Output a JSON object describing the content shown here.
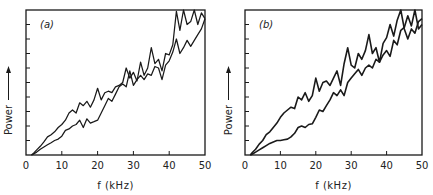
{
  "chart_data": [
    {
      "type": "line",
      "panel_label": "(a)",
      "title": "",
      "xlabel": "f (kHz)",
      "ylabel": "Power",
      "ylabel_arrow": true,
      "xlim": [
        0,
        50
      ],
      "ylim": [
        0,
        10
      ],
      "x_ticks": [
        0,
        10,
        20,
        30,
        40,
        50
      ],
      "x_tick_labels": [
        "0",
        "10",
        "20",
        "30",
        "40",
        "50"
      ],
      "y_ticks_unlabeled": 10,
      "grid": false,
      "legend": null,
      "x": [
        1.5,
        2,
        3,
        4,
        5,
        6,
        7,
        8,
        9,
        10,
        11,
        12,
        13,
        14,
        15,
        16,
        17,
        18,
        19,
        20,
        21,
        22,
        23,
        24,
        25,
        26,
        27,
        28,
        29,
        30,
        31,
        32,
        33,
        34,
        35,
        36,
        37,
        38,
        39,
        40,
        41,
        42,
        43,
        44,
        45,
        46,
        47,
        48,
        49,
        50
      ],
      "series": [
        {
          "name": "upper trace",
          "values": [
            0,
            0.1,
            0.35,
            0.6,
            0.9,
            1.25,
            1.4,
            1.6,
            1.9,
            2.1,
            2.4,
            2.9,
            3.1,
            2.9,
            3.6,
            3.4,
            3.7,
            3.3,
            3.8,
            4.6,
            3.8,
            4.3,
            4.4,
            4.3,
            4.7,
            4.8,
            5.0,
            6.0,
            5.3,
            5.7,
            5.1,
            6.4,
            5.5,
            6.0,
            7.4,
            6.3,
            6.6,
            5.8,
            7.0,
            6.9,
            7.6,
            9.9,
            8.6,
            10.0,
            9.0,
            9.2,
            10.0,
            9.0,
            9.8,
            9.4
          ]
        },
        {
          "name": "lower trace",
          "values": [
            0,
            0.05,
            0.2,
            0.4,
            0.55,
            0.7,
            0.85,
            1.0,
            1.1,
            1.3,
            1.7,
            1.8,
            2.0,
            2.1,
            2.4,
            1.9,
            2.5,
            2.2,
            2.3,
            2.4,
            2.9,
            3.4,
            3.9,
            3.7,
            4.2,
            4.7,
            4.9,
            4.7,
            5.8,
            4.8,
            5.2,
            5.5,
            5.2,
            5.6,
            5.5,
            6.1,
            6.0,
            5.2,
            6.2,
            6.5,
            7.1,
            8.0,
            7.0,
            7.4,
            7.9,
            7.5,
            7.9,
            8.3,
            8.7,
            9.4
          ]
        }
      ]
    },
    {
      "type": "line",
      "panel_label": "(b)",
      "title": "",
      "xlabel": "f (kHz)",
      "ylabel": "Power",
      "ylabel_arrow": true,
      "xlim": [
        0,
        50
      ],
      "ylim": [
        0,
        10
      ],
      "x_ticks": [
        0,
        10,
        20,
        30,
        40,
        50
      ],
      "x_tick_labels": [
        "0",
        "10",
        "20",
        "30",
        "40",
        "50"
      ],
      "y_ticks_unlabeled": 10,
      "grid": false,
      "legend": null,
      "x": [
        1.5,
        2,
        3,
        4,
        5,
        6,
        7,
        8,
        9,
        10,
        11,
        12,
        13,
        14,
        15,
        16,
        17,
        18,
        19,
        20,
        21,
        22,
        23,
        24,
        25,
        26,
        27,
        28,
        29,
        30,
        31,
        32,
        33,
        34,
        35,
        36,
        37,
        38,
        39,
        40,
        41,
        42,
        43,
        44,
        45,
        46,
        47,
        48,
        49,
        50
      ],
      "series": [
        {
          "name": "upper trace",
          "values": [
            0,
            0.15,
            0.4,
            0.75,
            1.0,
            1.4,
            1.6,
            1.9,
            2.2,
            2.6,
            2.9,
            3.1,
            3.3,
            3.2,
            4.0,
            3.8,
            4.3,
            3.7,
            4.1,
            5.3,
            4.4,
            5.0,
            5.1,
            4.8,
            5.3,
            5.8,
            4.8,
            6.3,
            7.4,
            6.2,
            6.0,
            7.0,
            6.6,
            7.2,
            8.3,
            7.0,
            7.4,
            6.4,
            7.7,
            8.1,
            9.0,
            8.2,
            9.3,
            10.0,
            8.7,
            8.0,
            8.7,
            8.4,
            9.2,
            9.4
          ]
        },
        {
          "name": "lower trace",
          "values": [
            0,
            0.05,
            0.2,
            0.35,
            0.5,
            0.65,
            0.8,
            0.9,
            1.0,
            1.0,
            1.05,
            1.1,
            1.25,
            1.5,
            1.9,
            2.0,
            1.9,
            2.1,
            2.15,
            2.6,
            3.1,
            3.0,
            3.4,
            3.8,
            4.3,
            4.1,
            4.5,
            4.1,
            5.0,
            5.3,
            5.6,
            5.9,
            5.5,
            6.0,
            6.2,
            6.0,
            6.6,
            6.4,
            6.9,
            7.2,
            6.8,
            7.9,
            7.6,
            8.6,
            8.8,
            9.6,
            8.9,
            10.0,
            8.7,
            9.0
          ]
        }
      ]
    }
  ],
  "panels": [
    {
      "label": "(a)",
      "xlabel": "f (kHz)",
      "ylabel": "Power"
    },
    {
      "label": "(b)",
      "xlabel": "f (kHz)",
      "ylabel": "Power"
    }
  ]
}
